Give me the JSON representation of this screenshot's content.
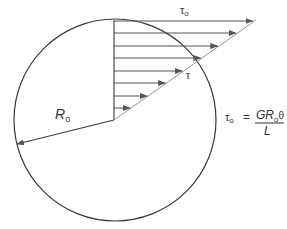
{
  "diagram": {
    "colors": {
      "stroke": "#3a3a3a",
      "arrow": "#555555",
      "text": "#333333"
    },
    "circle": {
      "cx": 115,
      "cy": 120,
      "r": 101
    },
    "center": {
      "x": 114,
      "y": 120
    },
    "diagonal_end": {
      "x": 255,
      "y": 20
    },
    "arrows_y": [
      21,
      33,
      46,
      58,
      71,
      83,
      96,
      108
    ],
    "labels": {
      "tau_o": {
        "main": "τ",
        "sub": "o"
      },
      "tau": "τ",
      "radius": {
        "main": "R",
        "sub": "o"
      },
      "formula": {
        "lhs_main": "τ",
        "lhs_sub": "o",
        "equals": "=",
        "num_G": "G",
        "num_R": "R",
        "num_sub": "o",
        "num_theta": "θ",
        "denominator": "L"
      }
    }
  }
}
